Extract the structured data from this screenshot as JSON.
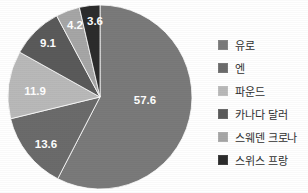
{
  "chart_data": {
    "type": "pie",
    "title": "",
    "subtitle": "",
    "xlabel": "",
    "ylabel": "",
    "grid": false,
    "legend_position": "right",
    "start_angle_deg": 0,
    "direction": "clockwise",
    "categories": [
      "유로",
      "엔",
      "파운드",
      "카나다 달러",
      "스웨덴 크로나",
      "스위스 프랑"
    ],
    "values": [
      57.6,
      13.6,
      11.9,
      9.1,
      4.2,
      3.6
    ],
    "labels": [
      "57.6",
      "13.6",
      "11.9",
      "9.1",
      "4.2",
      "3.6"
    ],
    "colors": [
      "#7a7a7a",
      "#6b6b6b",
      "#b9b9b9",
      "#5a5a5a",
      "#a6a6a6",
      "#2c2c2c"
    ],
    "slices": [
      {
        "name": "유로",
        "value": 57.6,
        "label": "57.6",
        "color": "#7a7a7a",
        "label_x": 139,
        "label_y": 97
      },
      {
        "name": "엔",
        "value": 13.6,
        "label": "13.6",
        "color": "#6b6b6b",
        "label_x": 40,
        "label_y": 141
      },
      {
        "name": "파운드",
        "value": 11.9,
        "label": "11.9",
        "color": "#b9b9b9",
        "label_x": 29,
        "label_y": 88
      },
      {
        "name": "카나다 달러",
        "value": 9.1,
        "label": "9.1",
        "color": "#5a5a5a",
        "label_x": 42,
        "label_y": 40
      },
      {
        "name": "스웨덴 크로나",
        "value": 4.2,
        "label": "4.2",
        "color": "#a6a6a6",
        "label_x": 69,
        "label_y": 22
      },
      {
        "name": "스위스 프랑",
        "value": 3.6,
        "label": "3.6",
        "color": "#2c2c2c",
        "label_x": 89,
        "label_y": 18
      }
    ]
  },
  "legend": {
    "items": [
      {
        "label": "유로",
        "color": "#7a7a7a"
      },
      {
        "label": "엔",
        "color": "#6b6b6b"
      },
      {
        "label": "파운드",
        "color": "#b9b9b9"
      },
      {
        "label": "카나다 달러",
        "color": "#5a5a5a"
      },
      {
        "label": "스웨덴 크로나",
        "color": "#a6a6a6"
      },
      {
        "label": "스위스 프랑",
        "color": "#2c2c2c"
      }
    ]
  }
}
